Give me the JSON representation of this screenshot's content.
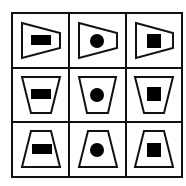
{
  "puzzle": {
    "title": "3x3 shape matrix",
    "grid": {
      "rows": 3,
      "cols": 3
    },
    "rows": [
      {
        "container": "trapezoid-pointing-right",
        "cells": [
          "rectangle",
          "circle",
          "square"
        ]
      },
      {
        "container": "trapezoid-inverted",
        "cells": [
          "rectangle",
          "circle",
          "square"
        ]
      },
      {
        "container": "trapezoid-upright",
        "cells": [
          "rectangle",
          "circle",
          "square"
        ]
      }
    ],
    "colors": {
      "line": "#111111",
      "fill": "#000000",
      "background": "#ffffff"
    }
  }
}
